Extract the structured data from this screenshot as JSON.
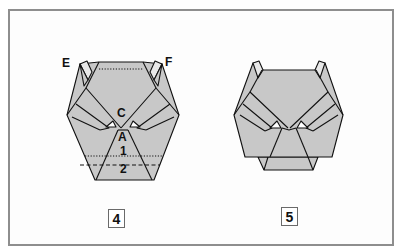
{
  "figure": {
    "type": "origami-folding-diagram",
    "fill_color": "#c8c8c8",
    "line_color": "#111111",
    "frame_color": "#8e8e8e",
    "steps": [
      {
        "number": "4",
        "labels": {
          "E": "E",
          "F": "F",
          "C": "C",
          "A": "A",
          "fold1": "1",
          "fold2": "2"
        },
        "fold_lines": [
          "dotted line near top edge",
          "dotted line 1 (valley)",
          "dashed line 2 (mountain)"
        ]
      },
      {
        "number": "5",
        "labels": {}
      }
    ]
  }
}
